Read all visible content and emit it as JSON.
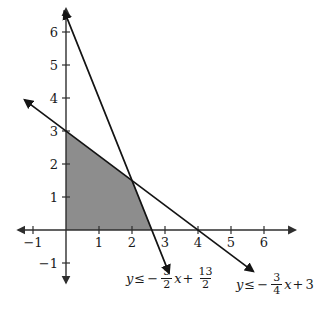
{
  "chart_data": {
    "type": "line",
    "title": "",
    "xlabel": "",
    "ylabel": "",
    "xlim": [
      -1.45,
      6.95
    ],
    "ylim": [
      -1.6,
      6.7
    ],
    "x_ticks": [
      -1,
      1,
      2,
      3,
      4,
      5,
      6
    ],
    "y_ticks": [
      -1,
      1,
      2,
      3,
      4,
      5,
      6
    ],
    "grid": false,
    "axis_color": "#2e2e2e",
    "line_color": "#141414",
    "shade_color": "#8d8d8d",
    "lines": [
      {
        "name": "boundary-line-1",
        "equation": "y = -5/2x + 13/2",
        "slope": -2.5,
        "intercept": 6.5,
        "x_start": -0.05,
        "x_end": 3.12,
        "label": "y ≤ −5/2 x + 13/2"
      },
      {
        "name": "boundary-line-2",
        "equation": "y = -3/4x + 3",
        "slope": -0.75,
        "intercept": 3,
        "x_start": -1.25,
        "x_end": 5.67,
        "label": "y ≤ −3/4 x + 3"
      }
    ],
    "region": {
      "description": "shaded solution region of the system of inequalities",
      "vertices": [
        [
          0,
          0
        ],
        [
          0,
          3
        ],
        [
          2,
          1.5
        ],
        [
          2.6,
          0
        ]
      ]
    }
  },
  "labels": {
    "eq1": {
      "lhs": "y",
      "rel": "≤",
      "minus": "−",
      "num1": "5",
      "den1": "2",
      "var": "x",
      "plus": "+",
      "num2": "13",
      "den2": "2"
    },
    "eq2": {
      "lhs": "y",
      "rel": "≤",
      "minus": "−",
      "num1": "3",
      "den1": "4",
      "var": "x",
      "plus": "+",
      "const": "3"
    }
  }
}
